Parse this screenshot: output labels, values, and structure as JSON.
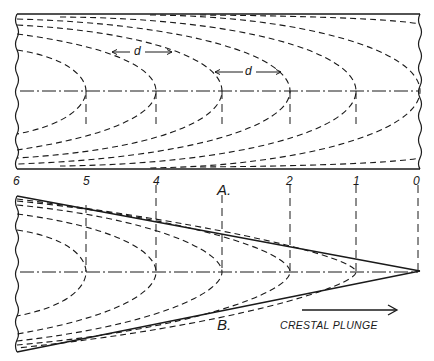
{
  "figure": {
    "panel_a_label": "A.",
    "panel_b_label": "B.",
    "distance_label": "d",
    "distance_label_2": "d",
    "direction_label": "CRESTAL PLUNGE",
    "section_numbers": [
      "6",
      "5",
      "4",
      "3",
      "2",
      "1",
      "0"
    ],
    "ink_color": "#1a1a1a",
    "background": "#ffffff"
  }
}
